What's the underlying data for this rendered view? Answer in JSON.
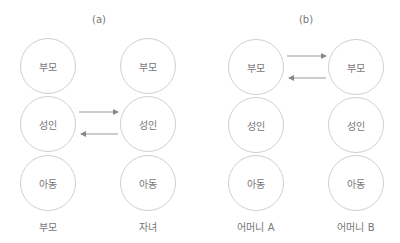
{
  "panels": [
    {
      "label": "(a)",
      "columns": [
        {
          "nodes": [
            "부모",
            "성인",
            "아동"
          ],
          "caption": "부모"
        },
        {
          "nodes": [
            "부모",
            "성인",
            "아동"
          ],
          "caption": "자녀"
        }
      ],
      "arrows": [
        {
          "from": "left.성인",
          "to": "right.성인",
          "direction": "right"
        },
        {
          "from": "right.성인",
          "to": "left.성인",
          "direction": "left"
        }
      ]
    },
    {
      "label": "(b)",
      "columns": [
        {
          "nodes": [
            "부모",
            "성인",
            "아동"
          ],
          "caption": "어머니 A"
        },
        {
          "nodes": [
            "부모",
            "성인",
            "아동"
          ],
          "caption": "어머니 B"
        }
      ],
      "arrows": [
        {
          "from": "left.부모",
          "to": "right.부모",
          "direction": "right"
        },
        {
          "from": "right.부모",
          "to": "left.부모",
          "direction": "left"
        }
      ]
    }
  ],
  "colors": {
    "circle": "#cfcfcf",
    "arrow": "#8a8a8a",
    "text": "#777777"
  }
}
